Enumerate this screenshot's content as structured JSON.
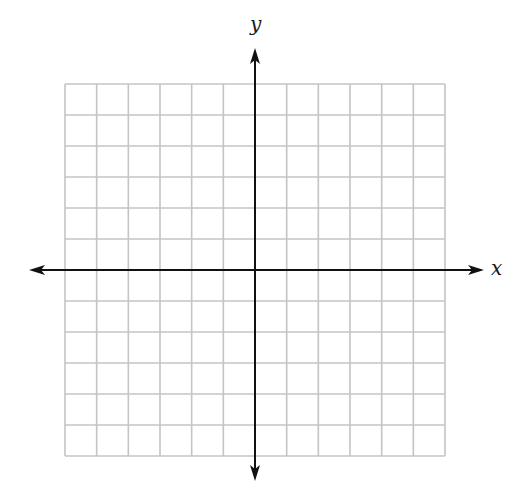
{
  "diagram": {
    "type": "coordinate-plane",
    "x_axis_label": "x",
    "y_axis_label": "y",
    "grid": {
      "columns": 12,
      "rows": 12,
      "left": 65,
      "top": 84,
      "right": 445,
      "bottom": 456,
      "line_color": "#c4c4c4"
    },
    "axes": {
      "color": "#111111",
      "origin_px": [
        255,
        270
      ],
      "x_arrow_from": 29,
      "x_arrow_to": 484,
      "y_arrow_from": 48,
      "y_arrow_to": 481
    }
  }
}
